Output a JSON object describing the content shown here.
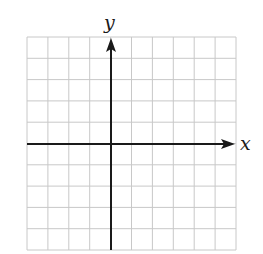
{
  "chart_data": {
    "type": "line",
    "title": "",
    "xlabel": "x",
    "ylabel": "y",
    "grid": true,
    "xlim": [
      -4,
      6
    ],
    "ylim": [
      -5,
      5
    ],
    "grid_columns": 10,
    "grid_rows": 10,
    "origin_cell": {
      "col": 4,
      "row": 5
    },
    "series": [],
    "tick_labels": {
      "x": [],
      "y": []
    },
    "legend": null
  },
  "labels": {
    "x_axis": "x",
    "y_axis": "y"
  },
  "colors": {
    "grid": "#c8c8c8",
    "axis": "#1a1a1a",
    "background": "#ffffff"
  }
}
